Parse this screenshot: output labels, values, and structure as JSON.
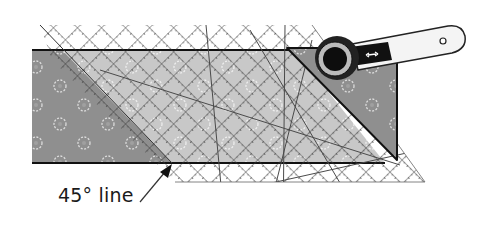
{
  "figure": {
    "annotation": {
      "text": "45° line"
    },
    "colors": {
      "dark_fabric": "#8f8f8f",
      "light_fabric": "#c9c9c9",
      "flower_motif": "#e6e6e6",
      "ruler_grid": "#3a3a3a",
      "outline": "#111111",
      "cutter_handle": "#f4f4f4",
      "cutter_blade": "#0d0d0d"
    },
    "elements": [
      "fabric-strip",
      "dark-fabric-left-triangle",
      "cut-off-triangle-right",
      "quilting-ruler",
      "rotary-cutter",
      "45-degree-line-arrow"
    ]
  }
}
